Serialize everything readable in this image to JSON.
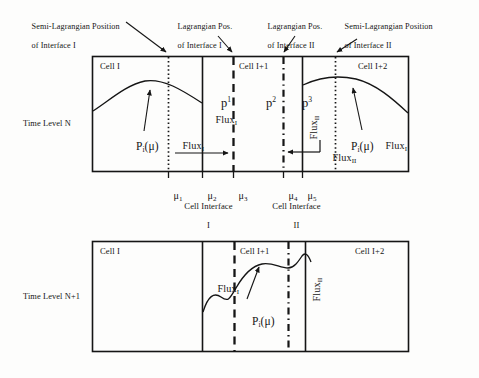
{
  "figure": {
    "annotations": [
      {
        "id": "semi-lag-1",
        "line1": "Semi-Lagrangian Position",
        "line2": "of Interface I"
      },
      {
        "id": "lag-1",
        "line1": "Lagrangian Pos.",
        "line2": "of Interface I"
      },
      {
        "id": "lag-2",
        "line1": "Lagrangian Pos.",
        "line2": "of Interface II"
      },
      {
        "id": "semi-lag-2",
        "line1": "Semi-Lagrangian Position",
        "line2": "of Interface II"
      }
    ],
    "time_levels": [
      {
        "id": "n",
        "label": "Time Level N"
      },
      {
        "id": "n1",
        "label": "Time Level N+1"
      }
    ],
    "panel_top": {
      "cells": [
        {
          "id": "cell-i",
          "label": "Cell I"
        },
        {
          "id": "cell-i1",
          "label": "Cell I+1"
        },
        {
          "id": "cell-i2",
          "label": "Cell I+2"
        }
      ],
      "pressure_fields": [
        {
          "id": "p1",
          "base": "p",
          "sup": "1"
        },
        {
          "id": "p2",
          "base": "p",
          "sup": "2"
        },
        {
          "id": "p3",
          "base": "p",
          "sup": "3"
        }
      ],
      "distributions": [
        {
          "id": "pi-mu-left",
          "base": "P",
          "sub": "i",
          "arg": "(μ)"
        },
        {
          "id": "pi-mu-right",
          "base": "P",
          "sub": "i",
          "arg": "(μ)"
        }
      ],
      "fluxes": [
        {
          "id": "flux-i-cell-i",
          "base": "Flux",
          "sub": "I"
        },
        {
          "id": "flux-i-cell-i1",
          "base": "Flux",
          "sub": "I"
        },
        {
          "id": "flux-ii-vert",
          "base": "Flux",
          "sub": "II"
        },
        {
          "id": "flux-ii-horiz",
          "base": "Flux",
          "sub": "II"
        },
        {
          "id": "flux-i-cell-i2",
          "base": "Flux",
          "sub": "I"
        }
      ]
    },
    "panel_bottom": {
      "cells": [
        {
          "id": "cell-i",
          "label": "Cell I"
        },
        {
          "id": "cell-i1",
          "label": "Cell I+1"
        },
        {
          "id": "cell-i2",
          "label": "Cell I+2"
        }
      ],
      "distributions": [
        {
          "id": "pi-mu",
          "base": "P",
          "sub": "i",
          "arg": "(μ)"
        }
      ],
      "fluxes": [
        {
          "id": "flux-i",
          "base": "Flux",
          "sub": "I"
        },
        {
          "id": "flux-ii",
          "base": "Flux",
          "sub": "II"
        }
      ]
    },
    "mu_ticks": [
      {
        "id": "mu1",
        "base": "μ",
        "sub": "1"
      },
      {
        "id": "mu2",
        "base": "μ",
        "sub": "2"
      },
      {
        "id": "mu3",
        "base": "μ",
        "sub": "3"
      },
      {
        "id": "mu4",
        "base": "μ",
        "sub": "4"
      },
      {
        "id": "mu5",
        "base": "μ",
        "sub": "5"
      }
    ],
    "interfaces": [
      {
        "id": "iface-1",
        "line1": "Cell Interface",
        "line2": "I"
      },
      {
        "id": "iface-2",
        "line1": "Cell Interface",
        "line2": "II"
      }
    ],
    "colors": {
      "stroke": "#151515",
      "background": "#fdfdfc",
      "bleed_text": "#d8d5cf"
    }
  },
  "background_bleed": {
    "rows": [
      {
        "id": "bleed-top",
        "text": " "
      },
      {
        "id": "bleed-mid-1",
        "text": " "
      },
      {
        "id": "bleed-mid-2",
        "text": " "
      }
    ]
  }
}
